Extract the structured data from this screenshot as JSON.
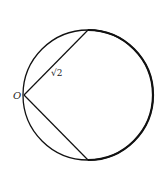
{
  "diagram": {
    "point_label": "O",
    "chord_label": "√2",
    "circle": {
      "cx": 88,
      "cy": 95,
      "r": 65
    },
    "point_o": {
      "x": 24,
      "y": 95
    },
    "chord_top_end": {
      "x": 88,
      "y": 30
    },
    "chord_bottom_end": {
      "x": 88,
      "y": 161
    },
    "stroke_color": "#111111"
  }
}
